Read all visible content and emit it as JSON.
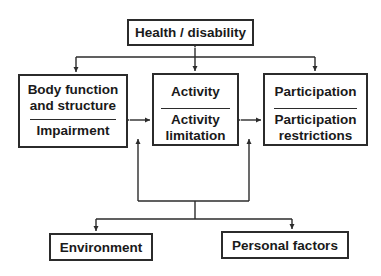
{
  "diagram": {
    "title_node": {
      "label": "Health / disability"
    },
    "components": [
      {
        "id": "body",
        "top_label": [
          "Body function",
          "and structure"
        ],
        "bottom_label": [
          "Impairment"
        ]
      },
      {
        "id": "activity",
        "top_label": [
          "Activity"
        ],
        "bottom_label": [
          "Activity",
          "limitation"
        ]
      },
      {
        "id": "participation",
        "top_label": [
          "Participation"
        ],
        "bottom_label": [
          "Participation",
          "restrictions"
        ]
      }
    ],
    "contextual_factors": [
      {
        "id": "environment",
        "label": "Environment"
      },
      {
        "id": "personal",
        "label": "Personal factors"
      }
    ],
    "edges": [
      {
        "from": "Health / disability",
        "to": "Body function and structure",
        "type": "bidirectional"
      },
      {
        "from": "Health / disability",
        "to": "Activity",
        "type": "bidirectional"
      },
      {
        "from": "Health / disability",
        "to": "Participation",
        "type": "bidirectional"
      },
      {
        "from": "Body function and structure",
        "to": "Activity",
        "type": "bidirectional"
      },
      {
        "from": "Activity",
        "to": "Participation",
        "type": "bidirectional"
      },
      {
        "from": "Contextual factors",
        "to": "Environment",
        "type": "directed"
      },
      {
        "from": "Contextual factors",
        "to": "Personal factors",
        "type": "directed"
      },
      {
        "from": "Contextual factors",
        "to": "Activity (left side)",
        "type": "directed"
      },
      {
        "from": "Contextual factors",
        "to": "Activity (right side)",
        "type": "directed"
      }
    ],
    "line_color": "#2b2b2b"
  }
}
